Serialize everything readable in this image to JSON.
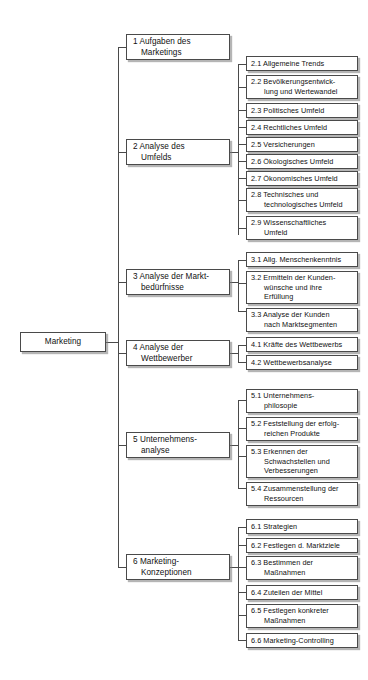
{
  "diagram": {
    "type": "tree",
    "title": "Marketing",
    "orientation": "left-to-right",
    "style": {
      "box_fill": "#ffffff",
      "box_border": "#4a4a4a",
      "shadow": "#787878",
      "line": "#4a4a4a",
      "text": "#111111",
      "background": "#ffffff"
    }
  },
  "root": {
    "label": "Marketing"
  },
  "level1": [
    {
      "id": "n1",
      "label": "1 Aufgaben des\nMarketings"
    },
    {
      "id": "n2",
      "label": "2 Analyse des\nUmfelds"
    },
    {
      "id": "n3",
      "label": "3 Analyse der Markt-\nbedürfnisse"
    },
    {
      "id": "n4",
      "label": "4 Analyse der\nWettbewerber"
    },
    {
      "id": "n5",
      "label": "5 Unternehmens-\nanalyse"
    },
    {
      "id": "n6",
      "label": "6 Marketing-\nKonzeptionen"
    }
  ],
  "level2": {
    "group2": [
      {
        "id": "n2_1",
        "label": "2.1 Allgemeine Trends"
      },
      {
        "id": "n2_2",
        "label": "2.2 Bevölkerungsentwick-\nlung und Wertewandel"
      },
      {
        "id": "n2_3",
        "label": "2.3 Politisches Umfeld"
      },
      {
        "id": "n2_4",
        "label": "2.4 Rechtliches Umfeld"
      },
      {
        "id": "n2_5",
        "label": "2.5 Versicherungen"
      },
      {
        "id": "n2_6",
        "label": "2.6 Ökologisches Umfeld"
      },
      {
        "id": "n2_7",
        "label": "2.7 Ökonomisches Umfeld"
      },
      {
        "id": "n2_8",
        "label": "2.8 Technisches und\ntechnologisches Umfeld"
      },
      {
        "id": "n2_9",
        "label": "2.9 Wissenschaftliches\nUmfeld"
      }
    ],
    "group3": [
      {
        "id": "n3_1",
        "label": "3.1 Allg. Menschenkenntnis"
      },
      {
        "id": "n3_2",
        "label": "3.2 Ermitteln der Kunden-\nwünsche und ihre\nErfüllung"
      },
      {
        "id": "n3_3",
        "label": "3.3 Analyse der Kunden\nnach Marktsegmenten"
      }
    ],
    "group4": [
      {
        "id": "n4_1",
        "label": "4.1 Kräfte des Wettbewerbs"
      },
      {
        "id": "n4_2",
        "label": "4.2 Wettbewerbsanalyse"
      }
    ],
    "group5": [
      {
        "id": "n5_1",
        "label": "5.1 Unternehmens-\nphilosopie"
      },
      {
        "id": "n5_2",
        "label": "5.2 Feststellung der erfolg-\nreichen Produkte"
      },
      {
        "id": "n5_3",
        "label": "5.3 Erkennen der\nSchwachstellen und\nVerbesserungen"
      },
      {
        "id": "n5_4",
        "label": "5.4 Zusammenstellung der\nRessourcen"
      }
    ],
    "group6": [
      {
        "id": "n6_1",
        "label": "6.1 Strategien"
      },
      {
        "id": "n6_2",
        "label": "6.2 Festlegen d. Marktziele"
      },
      {
        "id": "n6_3",
        "label": "6.3 Bestimmen der\nMaßnahmen"
      },
      {
        "id": "n6_4",
        "label": "6.4 Zuteilen der Mittel"
      },
      {
        "id": "n6_5",
        "label": "6.5 Festlegen konkreter\nMaßnahmen"
      },
      {
        "id": "n6_6",
        "label": "6.6 Marketing-Controlling"
      }
    ]
  }
}
